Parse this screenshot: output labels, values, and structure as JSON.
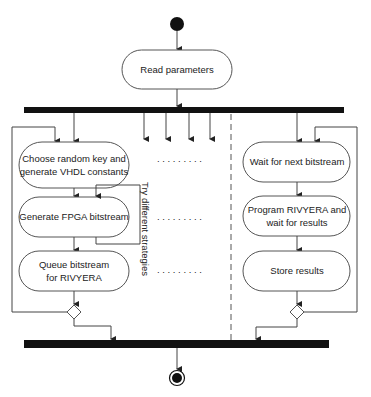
{
  "diagram": {
    "type": "UML activity diagram",
    "nodes": {
      "start": "initial-node",
      "read": "Read parameters",
      "left": {
        "a1_line1": "Choose random key and",
        "a1_line2": "generate VHDL constants",
        "a2": "Generate FPGA bitstream",
        "a3_line1": "Queue bitstream",
        "a3_line2": "for RIVYERA"
      },
      "right": {
        "b1": "Wait for next bitstream",
        "b2_line1": "Program RIVYERA and",
        "b2_line2": "wait for results",
        "b3": "Store results"
      },
      "loop_label": "Try different strategies",
      "dots": ". . . . . . . . .",
      "end": "final-node"
    },
    "colors": {
      "stroke": "#555555",
      "bar": "#111111",
      "text": "#222222"
    }
  }
}
